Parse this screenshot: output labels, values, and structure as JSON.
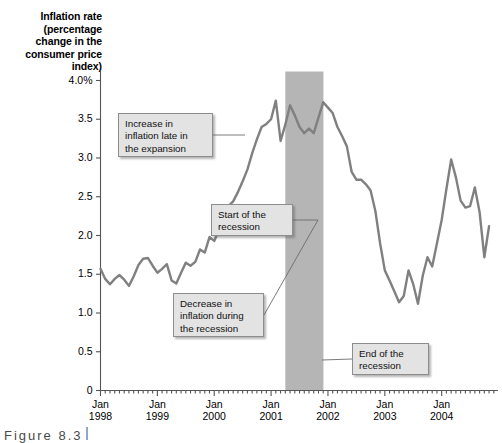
{
  "figure": {
    "caption": "Figure  8.3",
    "axis_title": "Inflation rate\n(percentage change\nin the consumer\nprice index)"
  },
  "chart_data": {
    "type": "line",
    "title": "",
    "xlabel": "",
    "ylabel": "Inflation rate (percentage change in the consumer price index)",
    "ylim": [
      0,
      4.0
    ],
    "ytick_values": [
      0,
      0.5,
      1.0,
      1.5,
      2.0,
      2.5,
      3.0,
      3.5,
      4.0
    ],
    "ytick_labels": [
      "0",
      "0.5",
      "1.0",
      "1.5",
      "2.0",
      "2.5",
      "3.0",
      "3.5",
      "4.0%"
    ],
    "xlim": [
      1998.0,
      2004.92
    ],
    "xtick_values": [
      1998,
      1999,
      2000,
      2001,
      2002,
      2003,
      2004
    ],
    "xtick_labels": [
      [
        "Jan",
        "1998"
      ],
      [
        "Jan",
        "1999"
      ],
      [
        "Jan",
        "2000"
      ],
      [
        "Jan",
        "2001"
      ],
      [
        "Jan",
        "2002"
      ],
      [
        "Jan",
        "2003"
      ],
      [
        "Jan",
        "2004"
      ]
    ],
    "minor_tick_interval_months": 1,
    "grid": false,
    "legend": null,
    "line_color": "#808080",
    "shaded_regions": [
      {
        "name": "recession-band",
        "x_start": 2001.25,
        "x_end": 2001.92,
        "color": "#b5b5b5",
        "label": "Recession"
      }
    ],
    "x": [
      1998.0,
      1998.083,
      1998.167,
      1998.25,
      1998.333,
      1998.417,
      1998.5,
      1998.583,
      1998.667,
      1998.75,
      1998.833,
      1998.917,
      1999.0,
      1999.083,
      1999.167,
      1999.25,
      1999.333,
      1999.417,
      1999.5,
      1999.583,
      1999.667,
      1999.75,
      1999.833,
      1999.917,
      2000.0,
      2000.083,
      2000.167,
      2000.25,
      2000.333,
      2000.417,
      2000.5,
      2000.583,
      2000.667,
      2000.75,
      2000.833,
      2000.917,
      2001.0,
      2001.083,
      2001.167,
      2001.25,
      2001.333,
      2001.417,
      2001.5,
      2001.583,
      2001.667,
      2001.75,
      2001.833,
      2001.917,
      2002.0,
      2002.083,
      2002.167,
      2002.25,
      2002.333,
      2002.417,
      2002.5,
      2002.583,
      2002.667,
      2002.75,
      2002.833,
      2002.917,
      2003.0,
      2003.083,
      2003.167,
      2003.25,
      2003.333,
      2003.417,
      2003.5,
      2003.583,
      2003.667,
      2003.75,
      2003.833,
      2003.917,
      2004.0,
      2004.083,
      2004.167,
      2004.25,
      2004.333,
      2004.417,
      2004.5,
      2004.583,
      2004.667,
      2004.75,
      2004.833
    ],
    "values": [
      1.57,
      1.44,
      1.37,
      1.44,
      1.49,
      1.43,
      1.35,
      1.47,
      1.62,
      1.7,
      1.71,
      1.61,
      1.52,
      1.57,
      1.63,
      1.42,
      1.38,
      1.52,
      1.65,
      1.61,
      1.66,
      1.82,
      1.78,
      1.98,
      1.93,
      2.07,
      2.3,
      2.38,
      2.44,
      2.56,
      2.7,
      2.85,
      3.06,
      3.24,
      3.4,
      3.44,
      3.5,
      3.74,
      3.22,
      3.43,
      3.68,
      3.55,
      3.4,
      3.32,
      3.38,
      3.32,
      3.52,
      3.72,
      3.65,
      3.58,
      3.4,
      3.28,
      3.15,
      2.82,
      2.72,
      2.72,
      2.66,
      2.58,
      2.32,
      1.9,
      1.55,
      1.42,
      1.28,
      1.14,
      1.22,
      1.55,
      1.37,
      1.12,
      1.48,
      1.72,
      1.6,
      1.9,
      2.2,
      2.6,
      2.98,
      2.75,
      2.45,
      2.36,
      2.38,
      2.62,
      2.3,
      1.72,
      2.12
    ],
    "annotations": [
      {
        "name": "increase-in-inflation-annotation",
        "text": "Increase in\ninflation late in\nthe expansion",
        "box": {
          "x": 118,
          "y": 113,
          "width": 95,
          "height": 44
        },
        "leader_to": {
          "x": 245,
          "y": 135
        }
      },
      {
        "name": "start-of-recession-annotation",
        "text": "Start of the\nrecession",
        "box": {
          "x": 211,
          "y": 204,
          "width": 82,
          "height": 32
        },
        "leader_to": {
          "x": 318,
          "y": 220
        }
      },
      {
        "name": "decrease-in-inflation-annotation",
        "text": "Decrease in\ninflation during\nthe recession",
        "box": {
          "x": 173,
          "y": 293,
          "width": 91,
          "height": 44
        },
        "leader_to": {
          "x": 318,
          "y": 220
        }
      },
      {
        "name": "end-of-recession-annotation",
        "text": "End of the\nrecession",
        "box": {
          "x": 352,
          "y": 343,
          "width": 77,
          "height": 32
        },
        "leader_to": {
          "x": 322,
          "y": 360
        }
      }
    ]
  }
}
